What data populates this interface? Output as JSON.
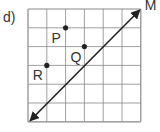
{
  "problem_label": "d)",
  "grid": {
    "columns": 6,
    "rows": 6
  },
  "line": {
    "name": "M",
    "from": [
      0,
      6
    ],
    "to": [
      6,
      0
    ],
    "arrows": "both"
  },
  "points": [
    {
      "name": "P",
      "col": 2,
      "row": 1
    },
    {
      "name": "Q",
      "col": 3,
      "row": 2
    },
    {
      "name": "R",
      "col": 1,
      "row": 3
    }
  ],
  "colors": {
    "grid": "#888888",
    "ink": "#222222"
  }
}
